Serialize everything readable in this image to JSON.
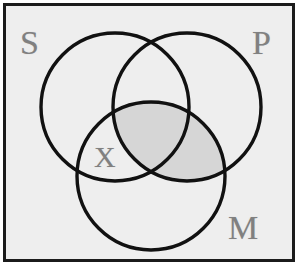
{
  "figure": {
    "type": "venn-diagram",
    "circle_count": 3,
    "background_color": "#eeeeee",
    "frame_color": "#1b1b1b",
    "stroke_color": "#111111",
    "label_color": "#808080",
    "shade_color": "#d6d6d6"
  },
  "labels": {
    "s": "S",
    "p": "P",
    "m": "M",
    "x": "X"
  },
  "circles": [
    {
      "name": "S",
      "cx": 112,
      "cy": 104,
      "r": 74
    },
    {
      "name": "P",
      "cx": 184,
      "cy": 104,
      "r": 74
    },
    {
      "name": "M",
      "cx": 148,
      "cy": 173,
      "r": 74
    }
  ],
  "regions": {
    "shaded": "P-and-M",
    "marked_with_x": "S-and-M-not-P"
  }
}
